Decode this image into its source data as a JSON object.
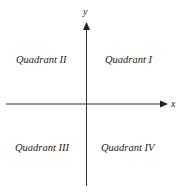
{
  "diagram": {
    "axes": {
      "x_label": "x",
      "y_label": "y",
      "color": "#333333"
    },
    "quadrants": [
      {
        "id": "I",
        "label": "Quadrant I"
      },
      {
        "id": "II",
        "label": "Quadrant II"
      },
      {
        "id": "III",
        "label": "Quadrant III"
      },
      {
        "id": "IV",
        "label": "Quadrant IV"
      }
    ]
  }
}
